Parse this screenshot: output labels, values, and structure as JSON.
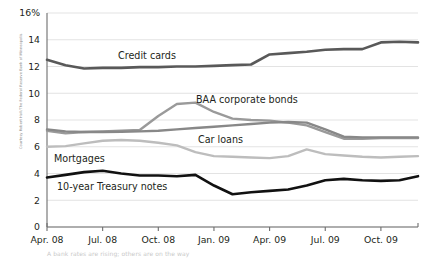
{
  "credit": "Courtesy Robert Hall/The Federal Reserve Bank of Minneapolis",
  "footnote": "A bank rates are rising; others are on the way",
  "chart_data": {
    "type": "line",
    "title": "",
    "xlabel": "",
    "ylabel": "",
    "ylim": [
      0,
      16
    ],
    "yticks": [
      0,
      2,
      4,
      6,
      8,
      10,
      12,
      14,
      16
    ],
    "ytick_labels": [
      "0",
      "2",
      "4",
      "6",
      "8",
      "10",
      "12",
      "14",
      "16%"
    ],
    "grid": true,
    "legend": "inline-annotations",
    "x": [
      "Apr. 08",
      "May 08",
      "Jun. 08",
      "Jul. 08",
      "Aug. 08",
      "Sep. 08",
      "Oct. 08",
      "Nov. 08",
      "Dec. 08",
      "Jan. 09",
      "Feb. 09",
      "Mar. 09",
      "Apr. 09",
      "May 09",
      "Jun. 09",
      "Jul. 09",
      "Aug. 09",
      "Sep. 09",
      "Oct. 09",
      "Nov. 09",
      "Dec. 09"
    ],
    "xtick_labels": [
      "Apr. 08",
      "Jul. 08",
      "Oct. 08",
      "Jan. 09",
      "Apr. 09",
      "Jul. 09",
      "Oct. 09"
    ],
    "series": [
      {
        "name": "Credit cards",
        "color": "#595959",
        "width": 2.6,
        "label_x": 118,
        "label_y": 59,
        "values": [
          12.5,
          12.1,
          11.85,
          11.9,
          11.9,
          11.95,
          11.95,
          12.0,
          12.0,
          12.05,
          12.1,
          12.15,
          12.9,
          13.0,
          13.1,
          13.25,
          13.3,
          13.3,
          13.8,
          13.85,
          13.8
        ]
      },
      {
        "name": "BAA corporate bonds",
        "color": "#9a9a9a",
        "width": 2.4,
        "label_x": 196,
        "label_y": 103,
        "values": [
          7.2,
          7.0,
          7.1,
          7.15,
          7.2,
          7.25,
          8.3,
          9.2,
          9.3,
          8.6,
          8.1,
          8.0,
          7.95,
          7.8,
          7.6,
          7.1,
          6.6,
          6.6,
          6.65,
          6.65,
          6.65
        ]
      },
      {
        "name": "Car loans",
        "color": "#888888",
        "width": 2.4,
        "label_x": 198,
        "label_y": 143,
        "values": [
          7.3,
          7.15,
          7.1,
          7.1,
          7.12,
          7.15,
          7.2,
          7.3,
          7.4,
          7.5,
          7.6,
          7.7,
          7.8,
          7.85,
          7.8,
          7.3,
          6.75,
          6.7,
          6.7,
          6.7,
          6.7
        ]
      },
      {
        "name": "Mortgages",
        "color": "#bdbdbd",
        "width": 2.4,
        "label_x": 54,
        "label_y": 162,
        "values": [
          6.0,
          6.05,
          6.25,
          6.45,
          6.5,
          6.45,
          6.3,
          6.1,
          5.6,
          5.3,
          5.25,
          5.2,
          5.15,
          5.3,
          5.8,
          5.45,
          5.35,
          5.25,
          5.2,
          5.25,
          5.3
        ]
      },
      {
        "name": "10-year Treasury notes",
        "color": "#111111",
        "width": 2.6,
        "label_x": 57,
        "label_y": 190,
        "values": [
          3.7,
          3.9,
          4.1,
          4.2,
          4.0,
          3.85,
          3.85,
          3.8,
          3.9,
          3.1,
          2.45,
          2.6,
          2.7,
          2.8,
          3.1,
          3.5,
          3.6,
          3.5,
          3.45,
          3.5,
          3.8
        ]
      }
    ]
  }
}
